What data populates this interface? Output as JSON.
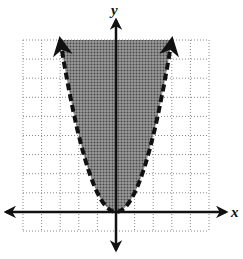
{
  "chart_data": {
    "type": "line",
    "title": "",
    "xlabel": "x",
    "ylabel": "y",
    "xlim": [
      -5,
      5
    ],
    "ylim": [
      -1,
      9
    ],
    "grid": true,
    "grid_style": "dotted",
    "legend": null,
    "series": [
      {
        "name": "y = x^2 (boundary)",
        "line_style": "dashed",
        "equation": "y = x^2",
        "x": [
          -3,
          -2,
          -1,
          0,
          1,
          2,
          3
        ],
        "y": [
          9,
          4,
          1,
          0,
          1,
          4,
          9
        ]
      }
    ],
    "shaded_region": "y > x^2",
    "colors": {
      "shade": "#7a7a7a",
      "curve": "#111111",
      "axes": "#111111",
      "grid": "#888888"
    }
  }
}
